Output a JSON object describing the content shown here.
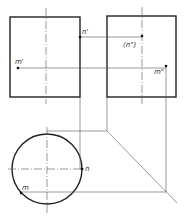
{
  "diagram": {
    "title": "",
    "labels": {
      "n_front": "n'",
      "m_front": "m'",
      "n_side": "(n\")",
      "m_side": "m\"",
      "n_top": "n",
      "m_top": "m"
    },
    "colors": {
      "outline": "#222222",
      "projection": "#555555",
      "centerline": "#555555",
      "background": "#ffffff"
    }
  }
}
